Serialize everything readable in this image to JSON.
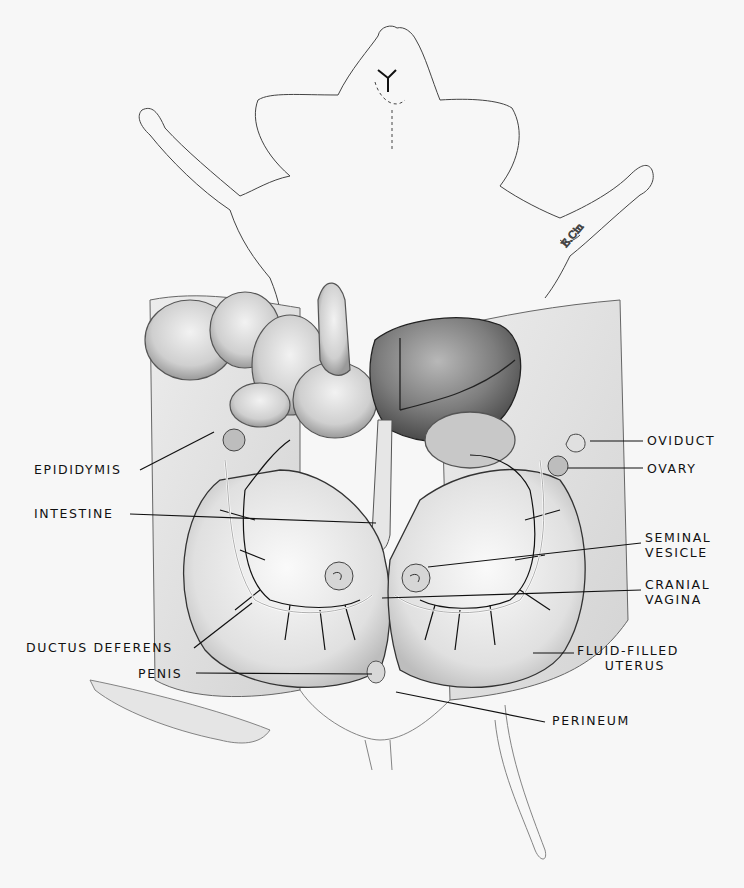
{
  "figure": {
    "background": "#f7f7f7",
    "ink": "#111111",
    "labels": [
      {
        "id": "epididymis",
        "text": "EPIDIDYMIS",
        "side": "left",
        "x": 34,
        "y": 462,
        "w": 100,
        "line": [
          [
            140,
            470
          ],
          [
            214,
            432
          ]
        ]
      },
      {
        "id": "intestine",
        "text": "INTESTINE",
        "side": "left",
        "x": 34,
        "y": 506,
        "w": 92,
        "line": [
          [
            130,
            514
          ],
          [
            376,
            523
          ]
        ]
      },
      {
        "id": "ductus-deferens",
        "text": "DUCTUS DEFERENS",
        "side": "left",
        "x": 26,
        "y": 640,
        "w": 166,
        "line": [
          [
            194,
            648
          ],
          [
            252,
            603
          ]
        ]
      },
      {
        "id": "penis",
        "text": "PENIS",
        "side": "left",
        "x": 138,
        "y": 666,
        "w": 54,
        "line": [
          [
            196,
            673
          ],
          [
            372,
            674
          ]
        ]
      },
      {
        "id": "oviduct",
        "text": "OVIDUCT",
        "side": "right",
        "x": 647,
        "y": 431,
        "line": [
          [
            590,
            441
          ],
          [
            643,
            441
          ]
        ]
      },
      {
        "id": "ovary",
        "text": "OVARY",
        "side": "right",
        "x": 647,
        "y": 459,
        "line": [
          [
            568,
            468
          ],
          [
            643,
            468
          ]
        ]
      },
      {
        "id": "seminal-vesicle",
        "text": "SEMINAL\nVESICLE",
        "side": "right",
        "x": 645,
        "y": 530,
        "line": [
          [
            428,
            567
          ],
          [
            641,
            543
          ]
        ]
      },
      {
        "id": "cranial-vagina",
        "text": "CRANIAL\nVAGINA",
        "side": "right",
        "x": 645,
        "y": 577,
        "line": [
          [
            382,
            598
          ],
          [
            641,
            590
          ]
        ]
      },
      {
        "id": "fluid-filled-uterus",
        "text": "FLUID-FILLED\n     UTERUS",
        "side": "right",
        "x": 577,
        "y": 643,
        "line": [
          [
            533,
            653
          ],
          [
            574,
            653
          ]
        ]
      },
      {
        "id": "perineum",
        "text": "PERINEUM",
        "side": "right",
        "x": 552,
        "y": 713,
        "line": [
          [
            396,
            692
          ],
          [
            545,
            722
          ]
        ]
      }
    ]
  }
}
